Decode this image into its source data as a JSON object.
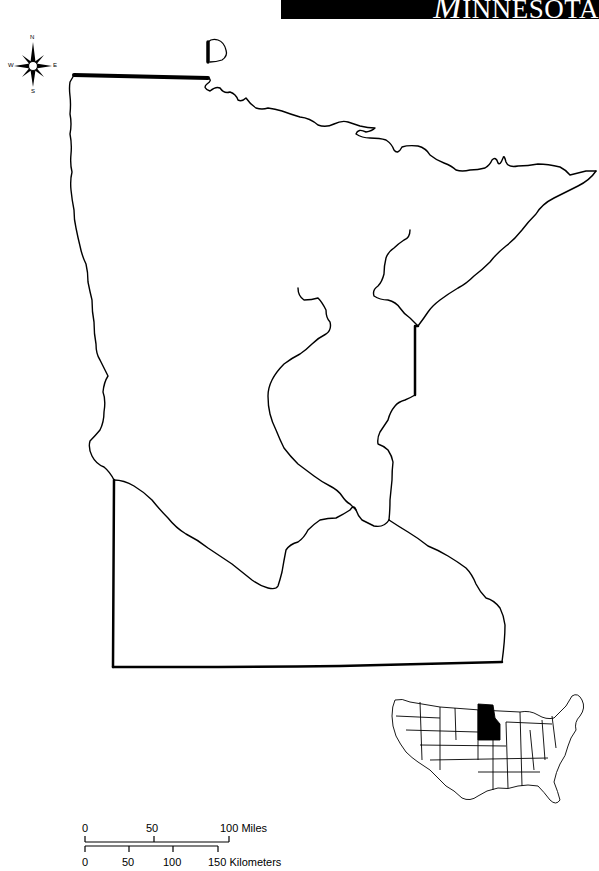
{
  "title": {
    "first_letter": "M",
    "rest": "INNESOTA"
  },
  "compass": {
    "north": "N",
    "south": "S",
    "east": "E",
    "west": "W"
  },
  "map": {
    "state": "Minnesota",
    "line_color": "#000000",
    "background": "#ffffff",
    "locator_highlight_color": "#000000"
  },
  "scale_bar": {
    "miles": {
      "ticks": [
        "0",
        "50",
        "100 Miles"
      ]
    },
    "kilometers": {
      "ticks": [
        "0",
        "50",
        "100",
        "150 Kilometers"
      ]
    }
  }
}
